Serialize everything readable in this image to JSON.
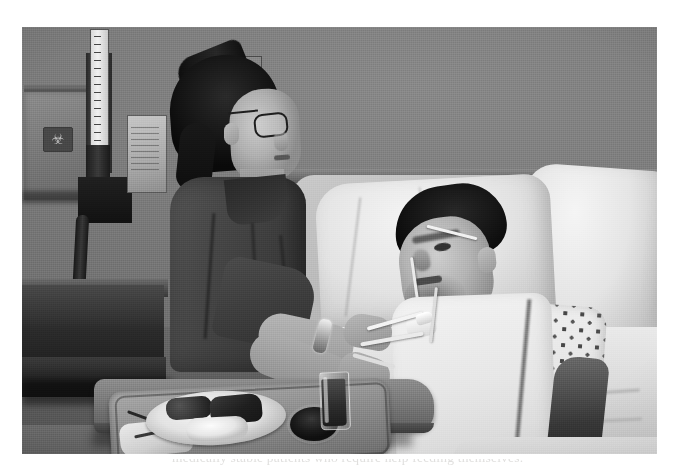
{
  "page": {
    "background_color": "#ffffff",
    "width": 678,
    "height": 472
  },
  "photo": {
    "type": "black-and-white photograph",
    "caption_partial": "medically stable patients who require help feeding themselves.",
    "frame": {
      "left": 22,
      "top": 27,
      "width": 635,
      "height": 427
    },
    "scene": {
      "setting": "hospital patient room",
      "subjects": [
        {
          "name": "nurse",
          "description": "female caregiver in dark scrubs with eyeglasses and ponytail, standing at bedside"
        },
        {
          "name": "patient",
          "description": "bearded man reclining in hospital bed wearing nasal cannula and dotted gown with white bib"
        }
      ]
    },
    "objects": [
      {
        "name": "sharps-container",
        "label": "biohazard"
      },
      {
        "name": "wall-manometer",
        "label": "blood pressure gauge"
      },
      {
        "name": "wall-chart",
        "label": "chart holder"
      },
      {
        "name": "outlet-plate",
        "label": "wall outlet"
      },
      {
        "name": "hospital-bed",
        "label": "bed with pillows"
      },
      {
        "name": "overbed-table",
        "label": "overbed tray table"
      },
      {
        "name": "meal-tray",
        "label": "meal tray"
      },
      {
        "name": "plate",
        "label": "dinner plate"
      },
      {
        "name": "bowl",
        "label": "side bowl"
      },
      {
        "name": "drinking-glass",
        "label": "juice glass"
      },
      {
        "name": "feeding-tube",
        "label": "feeding tube"
      },
      {
        "name": "cabinet",
        "label": "dark bedside cabinet"
      }
    ],
    "colors": {
      "wall": "#7d7c7a",
      "scrubs": "#464541",
      "linens": "#e6e5e0",
      "tray_table": "#7a7974",
      "cabinet_dark": "#1a1917",
      "hair": "#16151 4"
    }
  }
}
